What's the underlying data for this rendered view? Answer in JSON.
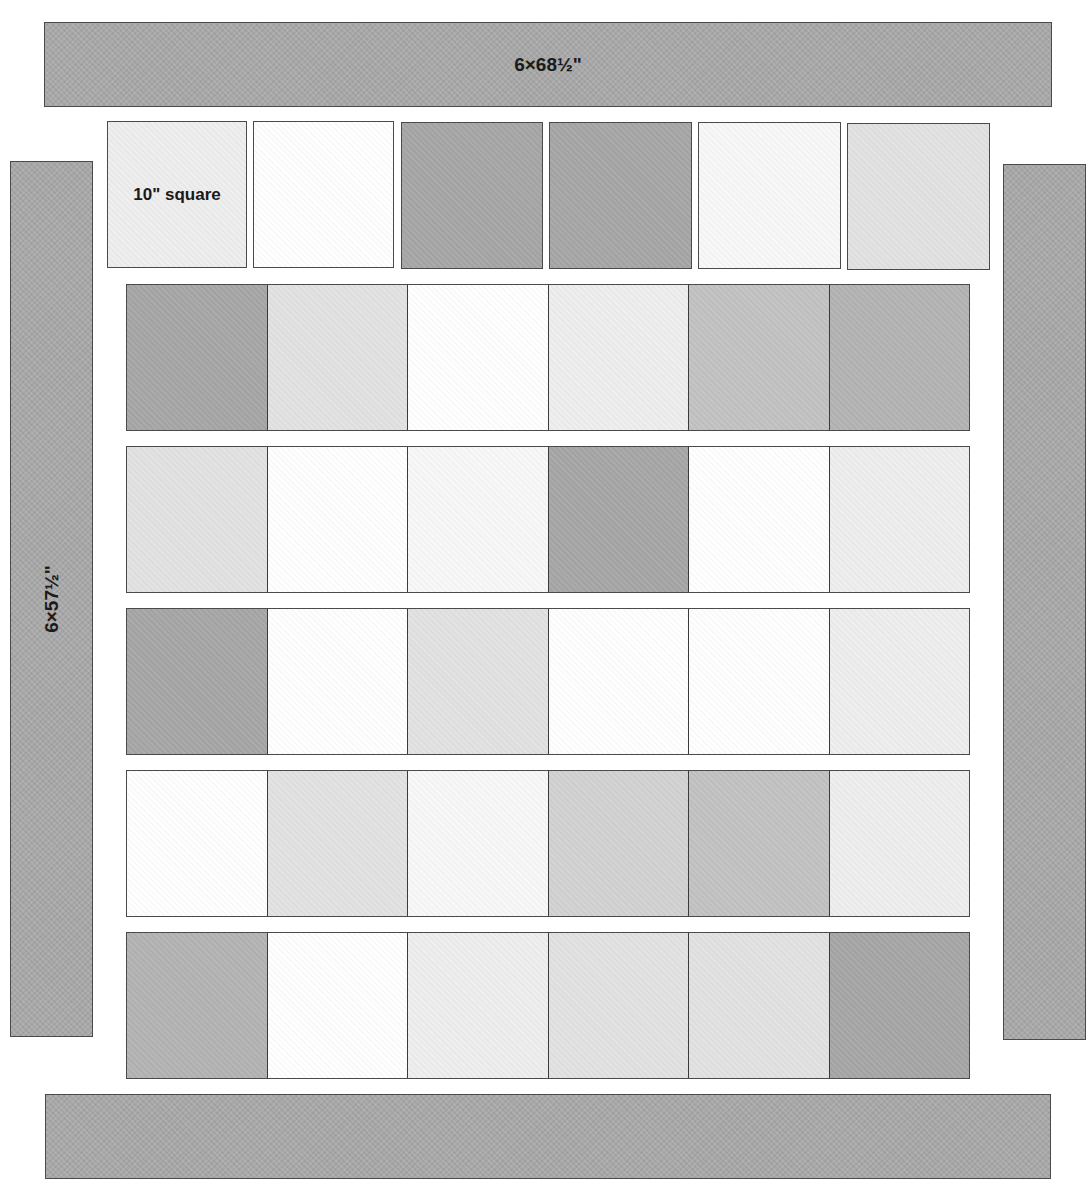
{
  "diagram": {
    "type": "quilt-assembly",
    "borders": {
      "top": {
        "label": "6×68½\"",
        "color": "#a9a9a9"
      },
      "left": {
        "label": "6×57½\"",
        "color": "#a9a9a9"
      },
      "right": {
        "label": "",
        "color": "#a9a9a9"
      },
      "bottom": {
        "label": "",
        "color": "#a9a9a9"
      }
    },
    "top_row": {
      "note": "separate (unsewn) squares",
      "squares": [
        {
          "label": "10\" square",
          "tone": "vlight"
        },
        {
          "label": "",
          "tone": "white"
        },
        {
          "label": "",
          "tone": "dark"
        },
        {
          "label": "",
          "tone": "dark"
        },
        {
          "label": "",
          "tone": "offwhite"
        },
        {
          "label": "",
          "tone": "light"
        }
      ]
    },
    "sewn_rows": [
      {
        "tones": [
          "dark",
          "light",
          "white",
          "vlight",
          "medium",
          "mdark"
        ]
      },
      {
        "tones": [
          "light",
          "white",
          "offwhite",
          "dark",
          "white",
          "vlight"
        ]
      },
      {
        "tones": [
          "dark",
          "white",
          "light",
          "white",
          "white",
          "vlight"
        ]
      },
      {
        "tones": [
          "white",
          "light",
          "offwhite",
          "lmed",
          "medium",
          "vlight"
        ]
      },
      {
        "tones": [
          "mdark",
          "white",
          "vlight",
          "light",
          "light",
          "dark"
        ]
      }
    ],
    "grid": {
      "columns": 6,
      "rows": 6,
      "square_size": "10\""
    },
    "palette": {
      "white": "#ffffff",
      "offwhite": "#f8f8f8",
      "vlight": "#eeeeee",
      "light": "#e2e2e2",
      "lmed": "#d2d2d2",
      "medium": "#c2c2c2",
      "mdark": "#b3b3b3",
      "dark": "#a6a6a6",
      "outline": "#4a4a4a"
    }
  }
}
